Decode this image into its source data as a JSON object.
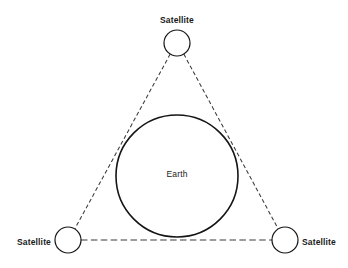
{
  "diagram": {
    "background_color": "#ffffff",
    "stroke_color": "#151515",
    "link_color": "#3a3a3a",
    "width": 348,
    "height": 268,
    "center_body": {
      "label": "Earth",
      "cx": 177,
      "cy": 176,
      "r": 61,
      "label_x": 177,
      "label_y": 175
    },
    "nodes": [
      {
        "id": "satellite-top",
        "label": "Satellite",
        "cx": 177,
        "cy": 43,
        "r": 13,
        "label_x": 177,
        "label_y": 21,
        "label_anchor": "middle"
      },
      {
        "id": "satellite-bottom-left",
        "label": "Satellite",
        "cx": 68,
        "cy": 240,
        "r": 13,
        "label_x": 51,
        "label_y": 243,
        "label_anchor": "end"
      },
      {
        "id": "satellite-bottom-right",
        "label": "Satellite",
        "cx": 285,
        "cy": 240,
        "r": 13,
        "label_x": 302,
        "label_y": 243,
        "label_anchor": "start"
      }
    ],
    "links": [
      {
        "id": "link-top-to-bottom-left",
        "style": "dashed",
        "x1": 170.2,
        "y1": 54.1,
        "x2": 74.8,
        "y2": 228.9
      },
      {
        "id": "link-top-to-bottom-right",
        "style": "dashed",
        "x1": 183.8,
        "y1": 54.1,
        "x2": 278.2,
        "y2": 228.9
      },
      {
        "id": "link-bottom-left-to-bottom-right",
        "style": "dashed",
        "x1": 81,
        "y1": 240,
        "x2": 272,
        "y2": 240
      }
    ]
  }
}
